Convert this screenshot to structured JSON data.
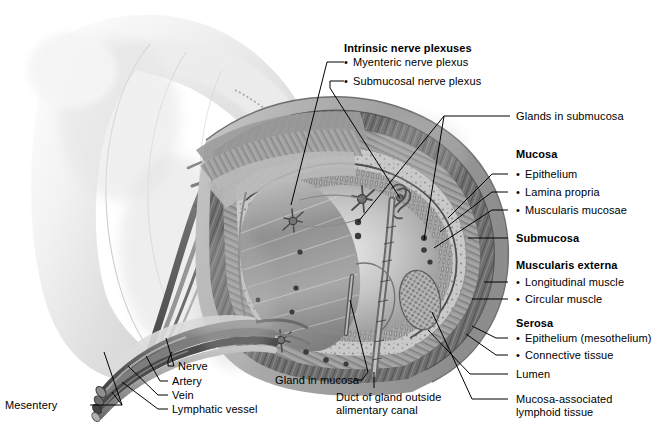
{
  "figure": {
    "style": "grayscale medical illustration",
    "width": 661,
    "height": 433,
    "background": "#ffffff",
    "ink": "#000000"
  },
  "labels": {
    "intrinsic_heading": "Intrinsic nerve plexuses",
    "myenteric": "Myenteric nerve plexus",
    "submucosal": "Submucosal nerve plexus",
    "glands_submucosa": "Glands in submucosa",
    "mucosa_heading": "Mucosa",
    "epithelium": "Epithelium",
    "lamina_propria": "Lamina propria",
    "muscularis_mucosae": "Muscularis mucosae",
    "submucosa_heading": "Submucosa",
    "muscularis_externa_heading": "Muscularis externa",
    "longitudinal_muscle": "Longitudinal muscle",
    "circular_muscle": "Circular muscle",
    "serosa_heading": "Serosa",
    "serosa_epithelium": "Epithelium (mesothelium)",
    "connective_tissue": "Connective tissue",
    "lumen": "Lumen",
    "malt_line1": "Mucosa-associated",
    "malt_line2": "lymphoid tissue",
    "gland_in_mucosa": "Gland in mucosa",
    "duct_line1": "Duct of gland outside",
    "duct_line2": "alimentary canal",
    "nerve": "Nerve",
    "artery": "Artery",
    "vein": "Vein",
    "lymphatic_vessel": "Lymphatic vessel",
    "mesentery": "Mesentery"
  },
  "structures": {
    "mesentery_sheet": "mesentery",
    "serosa_layer": "serosa",
    "longitudinal_muscle_layer": "longitudinal muscle",
    "circular_muscle_layer": "circular muscle",
    "submucosa_layer": "submucosa",
    "mucosa_layer": "mucosa",
    "lumen_space": "lumen",
    "vascular_bundle": "nerve artery vein lymphatic bundle",
    "gland_duct": "duct of gland outside alimentary canal",
    "lymphoid_nodule": "mucosa-associated lymphoid tissue"
  }
}
